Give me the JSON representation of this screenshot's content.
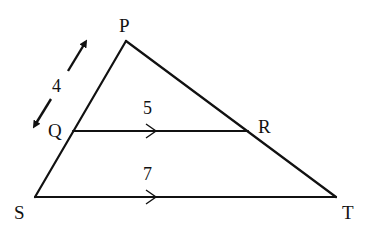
{
  "diagram": {
    "type": "triangle-with-parallel-segment",
    "vertices": {
      "P": {
        "label": "P",
        "x": 126,
        "y": 41
      },
      "Q": {
        "label": "Q",
        "x": 73,
        "y": 131
      },
      "R": {
        "label": "R",
        "x": 248,
        "y": 131
      },
      "S": {
        "label": "S",
        "x": 35,
        "y": 197
      },
      "T": {
        "label": "T",
        "x": 336,
        "y": 197
      }
    },
    "segments": {
      "PQ": {
        "length_label": "4"
      },
      "QR": {
        "length_label": "5"
      },
      "ST": {
        "length_label": "7"
      }
    },
    "parallel_marks": [
      "QR",
      "ST"
    ],
    "colors": {
      "stroke": "#111111",
      "background": "#ffffff"
    }
  }
}
